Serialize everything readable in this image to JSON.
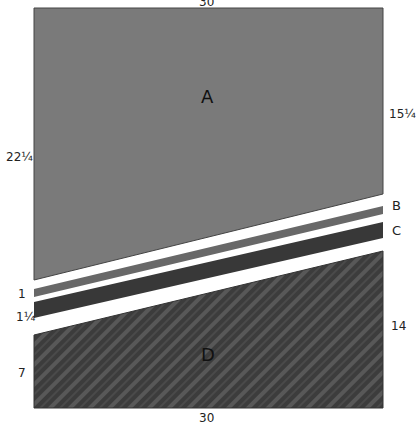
{
  "diagram": {
    "dimensions": {
      "top_width": "30",
      "bottom_width": "30",
      "left_height_top": "22¼",
      "right_height_top": "15¼",
      "left_strip_b": "1",
      "left_strip_c": "1¼",
      "left_height_bottom": "7",
      "right_height_bottom": "14"
    },
    "regions": {
      "a": "A",
      "b": "B",
      "c": "C",
      "d": "D"
    },
    "colors": {
      "region_a": "#7a7a7a",
      "region_b": "#6a6a6a",
      "region_c": "#3a3a3a",
      "region_d": "#3c3c3c",
      "region_d_stripe": "#575757",
      "gap": "#ffffff",
      "outline": "#333333"
    }
  }
}
